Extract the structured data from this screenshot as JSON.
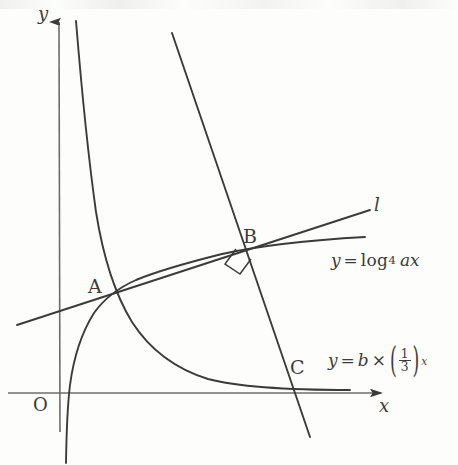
{
  "figure": {
    "type": "math-diagram",
    "background_color": "#fdfdfc",
    "stroke_color": "#3b3b3b"
  },
  "axes": {
    "x_label": "x",
    "y_label": "y",
    "origin_label": "O"
  },
  "points": [
    {
      "name": "A",
      "label": "A",
      "x": 110,
      "y": 296,
      "note": "intersection of log curve, exponential curve and line l"
    },
    {
      "name": "B",
      "label": "B",
      "x": 250,
      "y": 248,
      "note": "intersection of line l and the steep descending line; right angle marked"
    },
    {
      "name": "C",
      "label": "C",
      "x": 290,
      "y": 385,
      "note": "steep descending line meets the x-axis"
    }
  ],
  "markers": {
    "right_angle_at": "B",
    "right_angle_symbol": "square"
  },
  "curves": [
    {
      "name": "log-curve",
      "label_parts": {
        "lhs": "y",
        "equals": "=",
        "logname": "log",
        "base": "4",
        "argument": "ax"
      },
      "label_plain": "y = log_4 ax"
    },
    {
      "name": "exponential-curve",
      "label_parts": {
        "lhs": "y",
        "equals": "=",
        "coefficient": "b",
        "times": "×",
        "numerator": "1",
        "denominator": "3",
        "exponent": "x"
      },
      "label_plain": "y = b × (1/3)^x"
    },
    {
      "name": "line-l",
      "label": "l"
    },
    {
      "name": "steep-line",
      "label": ""
    }
  ]
}
